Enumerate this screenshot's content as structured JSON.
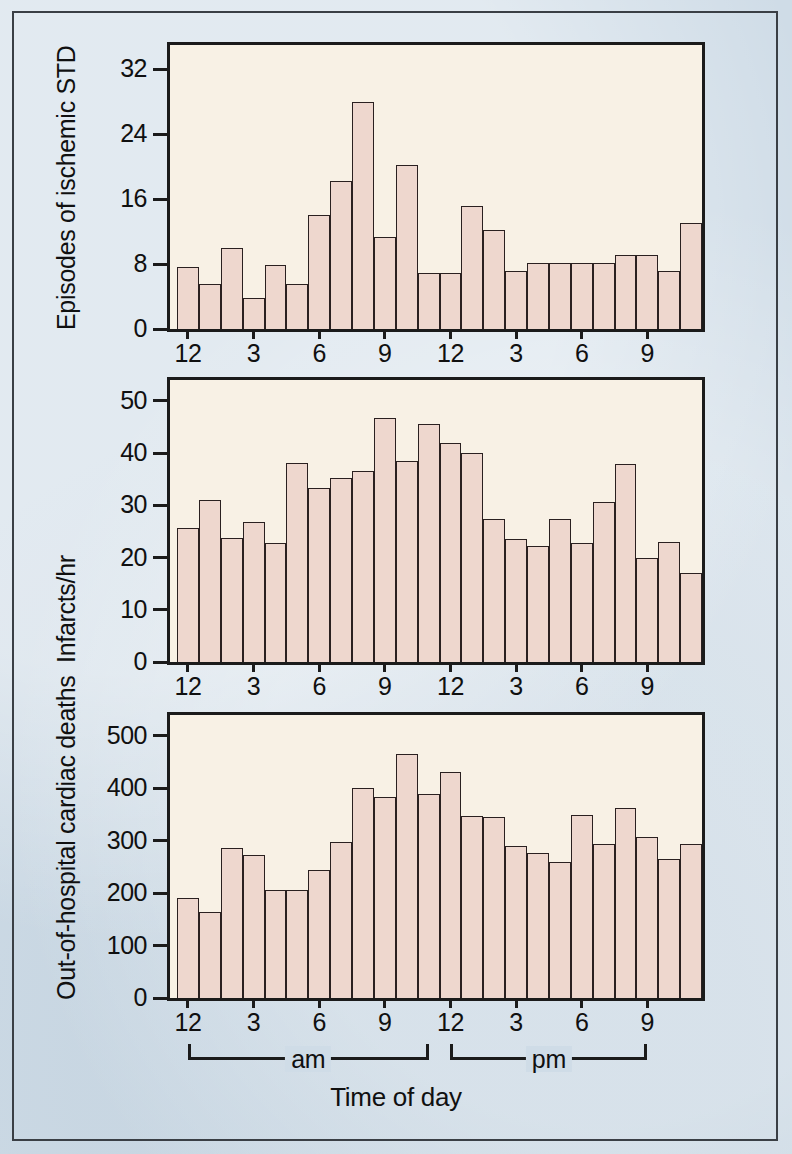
{
  "figure": {
    "background_color": "#cfdce7",
    "plot_background_color": "#f8f1e5",
    "bar_fill_color": "#eed7ce",
    "bar_outline_color": "#2a2020",
    "xaxis_title": "Time of day",
    "period_brackets": [
      {
        "label": "am",
        "start_hour": 0,
        "end_hour": 12
      },
      {
        "label": "pm",
        "start_hour": 12,
        "end_hour": 22
      }
    ],
    "shared_x_tick_labels": [
      "12",
      "3",
      "6",
      "9",
      "12",
      "3",
      "6",
      "9"
    ],
    "shared_x_tick_hours": [
      0,
      3,
      6,
      9,
      12,
      15,
      18,
      21
    ]
  },
  "chart_data": [
    {
      "type": "bar",
      "title": "",
      "ylabel": "Episodes of ischemic STD",
      "xlabel": "Time of day",
      "ylim": [
        0,
        35
      ],
      "yticks": [
        0,
        8,
        16,
        24,
        32
      ],
      "ytick_labels": [
        "0",
        "8",
        "16",
        "24",
        "32"
      ],
      "grid": false,
      "legend": "none",
      "categories": [
        "12am",
        "1am",
        "2am",
        "3am",
        "4am",
        "5am",
        "6am",
        "7am",
        "8am",
        "9am",
        "10am",
        "11am",
        "12pm",
        "1pm",
        "2pm",
        "3pm",
        "4pm",
        "5pm",
        "6pm",
        "7pm",
        "8pm",
        "9pm",
        "10pm",
        "11pm"
      ],
      "values": [
        7.7,
        5.5,
        10.0,
        3.8,
        7.9,
        5.6,
        14.0,
        18.3,
        28.0,
        11.3,
        20.2,
        6.9,
        6.9,
        15.2,
        12.2,
        7.2,
        8.1,
        8.1,
        8.1,
        8.1,
        9.1,
        9.1,
        7.2,
        13.1
      ]
    },
    {
      "type": "bar",
      "title": "",
      "ylabel": "Infarcts/hr",
      "xlabel": "Time of day",
      "ylim": [
        0,
        54
      ],
      "yticks": [
        0,
        10,
        20,
        30,
        40,
        50
      ],
      "ytick_labels": [
        "0",
        "10",
        "20",
        "30",
        "40",
        "50"
      ],
      "grid": false,
      "legend": "none",
      "categories": [
        "12am",
        "1am",
        "2am",
        "3am",
        "4am",
        "5am",
        "6am",
        "7am",
        "8am",
        "9am",
        "10am",
        "11am",
        "12pm",
        "1pm",
        "2pm",
        "3pm",
        "4pm",
        "5pm",
        "6pm",
        "7pm",
        "8pm",
        "9pm",
        "10pm",
        "11pm"
      ],
      "values": [
        25.7,
        31.0,
        23.7,
        26.8,
        22.8,
        38.2,
        33.3,
        35.2,
        36.6,
        46.7,
        38.5,
        45.6,
        42.0,
        40.0,
        27.4,
        23.6,
        22.2,
        27.4,
        22.7,
        30.7,
        37.9,
        19.9,
        23.0,
        17.0
      ]
    },
    {
      "type": "bar",
      "title": "",
      "ylabel": "Out-of-hospital cardiac deaths",
      "xlabel": "Time of day",
      "ylim": [
        0,
        540
      ],
      "yticks": [
        0,
        100,
        200,
        300,
        400,
        500
      ],
      "ytick_labels": [
        "0",
        "100",
        "200",
        "300",
        "400",
        "500"
      ],
      "grid": false,
      "legend": "none",
      "categories": [
        "12am",
        "1am",
        "2am",
        "3am",
        "4am",
        "5am",
        "6am",
        "7am",
        "8am",
        "9am",
        "10am",
        "11am",
        "12pm",
        "1pm",
        "2pm",
        "3pm",
        "4pm",
        "5pm",
        "6pm",
        "7pm",
        "8pm",
        "9pm",
        "10pm",
        "11pm"
      ],
      "values": [
        190,
        165,
        287,
        272,
        206,
        206,
        245,
        298,
        400,
        384,
        465,
        390,
        432,
        348,
        346,
        290,
        276,
        260,
        350,
        293,
        363,
        308,
        265,
        293
      ]
    }
  ]
}
